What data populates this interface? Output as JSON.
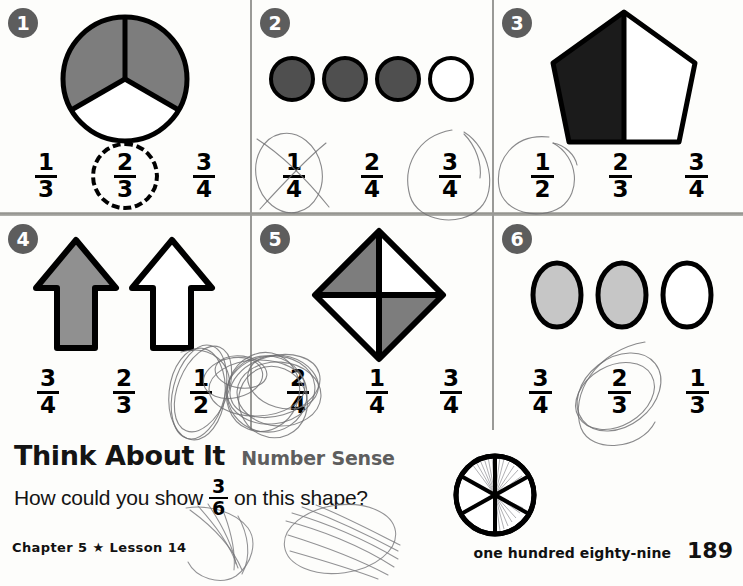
{
  "worksheet": {
    "exercises": [
      {
        "number": "1",
        "figure": "circle-thirds-two-shaded",
        "choices": [
          {
            "num": "1",
            "den": "3",
            "marked": "none"
          },
          {
            "num": "2",
            "den": "3",
            "marked": "dashed-ring"
          },
          {
            "num": "3",
            "den": "4",
            "marked": "none"
          }
        ]
      },
      {
        "number": "2",
        "figure": "four-circles-three-shaded",
        "choices": [
          {
            "num": "1",
            "den": "4",
            "marked": "pencil-circle-crossed"
          },
          {
            "num": "2",
            "den": "4",
            "marked": "none"
          },
          {
            "num": "3",
            "den": "4",
            "marked": "pencil-circle"
          }
        ]
      },
      {
        "number": "3",
        "figure": "pentagon-half-shaded",
        "choices": [
          {
            "num": "1",
            "den": "2",
            "marked": "pencil-circle"
          },
          {
            "num": "2",
            "den": "3",
            "marked": "none"
          },
          {
            "num": "3",
            "den": "4",
            "marked": "none"
          }
        ]
      },
      {
        "number": "4",
        "figure": "two-arrows-one-shaded",
        "choices": [
          {
            "num": "3",
            "den": "4",
            "marked": "none"
          },
          {
            "num": "2",
            "den": "3",
            "marked": "none"
          },
          {
            "num": "1",
            "den": "2",
            "marked": "pencil-circle"
          }
        ]
      },
      {
        "number": "5",
        "figure": "diamond-quarters-two-shaded",
        "choices": [
          {
            "num": "2",
            "den": "4",
            "marked": "pencil-scribble"
          },
          {
            "num": "1",
            "den": "4",
            "marked": "none"
          },
          {
            "num": "3",
            "den": "4",
            "marked": "none"
          }
        ]
      },
      {
        "number": "6",
        "figure": "three-ovals-two-shaded",
        "choices": [
          {
            "num": "3",
            "den": "4",
            "marked": "none"
          },
          {
            "num": "2",
            "den": "3",
            "marked": "pencil-circle"
          },
          {
            "num": "1",
            "den": "3",
            "marked": "none"
          }
        ]
      }
    ]
  },
  "think_about_it": {
    "title": "Think About It",
    "subtitle": "Number Sense",
    "question_before": "How could you show",
    "fraction": {
      "num": "3",
      "den": "6"
    },
    "question_after": "on this shape?",
    "shape": "circle-sixths-three-shaded"
  },
  "footer": {
    "chapter": "Chapter 5",
    "star": "★",
    "lesson": "Lesson 14",
    "page_words": "one hundred eighty-nine",
    "page_number": "189"
  },
  "colors": {
    "shade_medium": "#7d7d7d",
    "shade_dark": "#4f4f4f",
    "shade_black": "#1b1b1b",
    "shade_light": "#c6c6c6",
    "badge_bg": "#5d5d5d",
    "pencil": "#6f6f72",
    "rule": "#9a9a97"
  }
}
